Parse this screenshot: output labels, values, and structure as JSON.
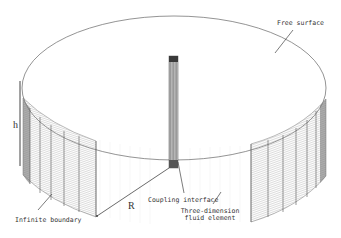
{
  "figure": {
    "labels": {
      "free_surface": "Free surface",
      "h": "h",
      "R": "R",
      "coupling_interface": "Coupling interface",
      "three_dimension_line1": "Three-dimension",
      "three_dimension_line2": "fluid element",
      "infinite_boundary": "Infinite boundary"
    },
    "colors": {
      "outline": "#555555",
      "mesh": "#8a8a8a",
      "column": "#6e6e6e",
      "column_top": "#3a3a3a",
      "background": "#ffffff"
    }
  }
}
